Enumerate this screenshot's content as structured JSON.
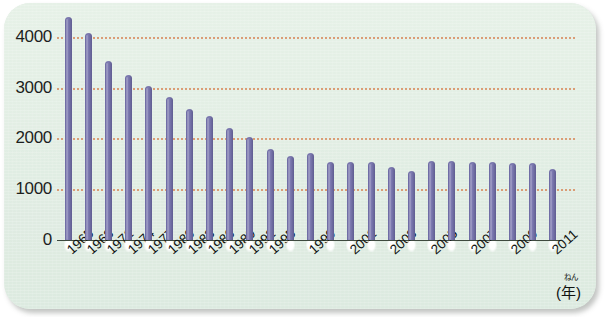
{
  "chart_data": {
    "type": "bar",
    "title": "",
    "xlabel": "年",
    "xlabel_ruby": "ねん",
    "ylabel": "",
    "ylim": [
      0,
      4500
    ],
    "yticks": [
      0,
      1000,
      2000,
      3000,
      4000
    ],
    "ytick_labels": [
      "0",
      "1000",
      "2000",
      "3000",
      "4000"
    ],
    "grid": "horizontal-dotted",
    "legend": "none",
    "categories": [
      "1965",
      "1968",
      "1971",
      "1974",
      "1977",
      "1980",
      "1983",
      "1986",
      "1989",
      "1992",
      "1995",
      "1997",
      "1999",
      "2000",
      "2001",
      "2002",
      "2003",
      "2004",
      "2005",
      "2006",
      "2007",
      "2008",
      "2009",
      "2010",
      "2011"
    ],
    "tick_labels": [
      "1965",
      "1968",
      "1971",
      "1974",
      "1977",
      "1980",
      "1983",
      "1986",
      "1989",
      "1992",
      "1995",
      "",
      "1999",
      "",
      "2001",
      "",
      "2003",
      "",
      "2005",
      "",
      "2007",
      "",
      "2009",
      "",
      "2011"
    ],
    "values": [
      4390,
      4080,
      3530,
      3240,
      3030,
      2810,
      2580,
      2440,
      2210,
      2030,
      1790,
      1660,
      1720,
      1540,
      1540,
      1540,
      1430,
      1350,
      1560,
      1560,
      1540,
      1540,
      1510,
      1520,
      1390
    ],
    "bar_color": "#6d6aa3",
    "grid_color": "#d98f63",
    "background_color": "#e2eee4",
    "axis_color": "#3f4a3f"
  }
}
